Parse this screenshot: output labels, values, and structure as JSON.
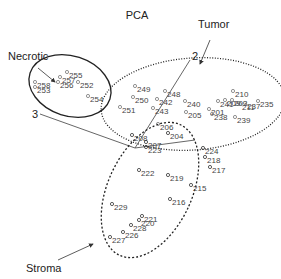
{
  "chart_data": {
    "type": "scatter",
    "title": "PCA",
    "axes": [
      {
        "label": "2",
        "from": [
          135,
          148
        ],
        "to": [
          190,
          60
        ]
      },
      {
        "label": "3",
        "from": [
          135,
          148
        ],
        "to": [
          40,
          114
        ]
      },
      {
        "label": "",
        "from": [
          135,
          148
        ],
        "to": [
          195,
          140
        ]
      }
    ],
    "groups": [
      {
        "name": "Necrotic",
        "ellipse": {
          "cx": 70,
          "cy": 86,
          "rx": 42,
          "ry": 30,
          "rotate": 18,
          "style": "solid"
        },
        "label_pos": [
          8,
          60
        ],
        "arrow": {
          "from": [
            38,
            68
          ],
          "to": [
            55,
            82
          ]
        },
        "points": [
          {
            "id": "255",
            "x": 67,
            "y": 72
          },
          {
            "id": "257",
            "x": 60,
            "y": 77
          },
          {
            "id": "256",
            "x": 58,
            "y": 82
          },
          {
            "id": "252",
            "x": 78,
            "y": 82
          },
          {
            "id": "258",
            "x": 35,
            "y": 82
          },
          {
            "id": "253",
            "x": 35,
            "y": 87
          },
          {
            "id": "254",
            "x": 88,
            "y": 96
          }
        ]
      },
      {
        "name": "Tumor",
        "ellipse": {
          "cx": 193,
          "cy": 104,
          "rx": 92,
          "ry": 46,
          "rotate": -4,
          "style": "dotted"
        },
        "label_pos": [
          198,
          28
        ],
        "arrow": {
          "from": [
            210,
            40
          ],
          "to": [
            200,
            64
          ]
        },
        "points": [
          {
            "id": "249",
            "x": 135,
            "y": 86
          },
          {
            "id": "248",
            "x": 165,
            "y": 91
          },
          {
            "id": "250",
            "x": 133,
            "y": 97
          },
          {
            "id": "242",
            "x": 157,
            "y": 99
          },
          {
            "id": "243",
            "x": 153,
            "y": 108
          },
          {
            "id": "251",
            "x": 120,
            "y": 107
          },
          {
            "id": "240",
            "x": 185,
            "y": 101
          },
          {
            "id": "210",
            "x": 233,
            "y": 91
          },
          {
            "id": "241",
            "x": 218,
            "y": 101
          },
          {
            "id": "209",
            "x": 225,
            "y": 100
          },
          {
            "id": "203",
            "x": 232,
            "y": 100
          },
          {
            "id": "211",
            "x": 240,
            "y": 104
          },
          {
            "id": "237",
            "x": 245,
            "y": 103
          },
          {
            "id": "235",
            "x": 258,
            "y": 101
          },
          {
            "id": "205",
            "x": 186,
            "y": 112
          },
          {
            "id": "201",
            "x": 209,
            "y": 109
          },
          {
            "id": "238",
            "x": 212,
            "y": 114
          },
          {
            "id": "239",
            "x": 235,
            "y": 117
          },
          {
            "id": "206",
            "x": 158,
            "y": 124
          }
        ]
      },
      {
        "name": "Stroma",
        "ellipse": {
          "cx": 150,
          "cy": 190,
          "rx": 42,
          "ry": 72,
          "rotate": 25,
          "style": "dashed"
        },
        "label_pos": [
          26,
          272
        ],
        "arrow": {
          "from": [
            58,
            260
          ],
          "to": [
            93,
            244
          ]
        },
        "points": [
          {
            "id": "208",
            "x": 132,
            "y": 135
          },
          {
            "id": "204",
            "x": 168,
            "y": 133
          },
          {
            "id": "207",
            "x": 146,
            "y": 142
          },
          {
            "id": "223",
            "x": 146,
            "y": 147
          },
          {
            "id": "224",
            "x": 203,
            "y": 148
          },
          {
            "id": "218",
            "x": 205,
            "y": 157
          },
          {
            "id": "217",
            "x": 210,
            "y": 167
          },
          {
            "id": "222",
            "x": 139,
            "y": 170
          },
          {
            "id": "219",
            "x": 168,
            "y": 175
          },
          {
            "id": "215",
            "x": 191,
            "y": 185
          },
          {
            "id": "216",
            "x": 170,
            "y": 199
          },
          {
            "id": "229",
            "x": 112,
            "y": 204
          },
          {
            "id": "221",
            "x": 142,
            "y": 216
          },
          {
            "id": "220",
            "x": 139,
            "y": 220
          },
          {
            "id": "228",
            "x": 131,
            "y": 225
          },
          {
            "id": "226",
            "x": 123,
            "y": 232
          },
          {
            "id": "227",
            "x": 110,
            "y": 237
          }
        ]
      }
    ]
  }
}
